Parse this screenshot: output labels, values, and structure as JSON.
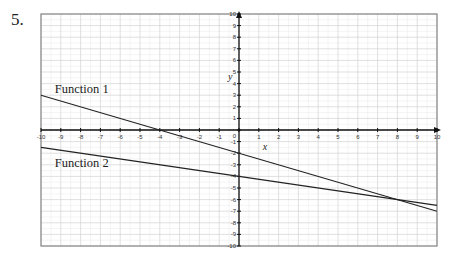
{
  "problem": {
    "number": "5.",
    "cut_text": "...ly ...p ... ...g... ... ...y..."
  },
  "chart_data": {
    "type": "line",
    "title": "",
    "xlabel": "x",
    "ylabel": "y",
    "xlim": [
      -10,
      10
    ],
    "ylim": [
      -10,
      10
    ],
    "grid": true,
    "minor_grid": true,
    "x_ticks": [
      -10,
      -9,
      -8,
      -7,
      -6,
      -5,
      -4,
      -3,
      -2,
      -1,
      0,
      1,
      2,
      3,
      4,
      5,
      6,
      7,
      8,
      9,
      10
    ],
    "y_ticks": [
      -10,
      -9,
      -8,
      -7,
      -6,
      -5,
      -4,
      -3,
      -2,
      -1,
      0,
      1,
      2,
      3,
      4,
      5,
      6,
      7,
      8,
      9,
      10
    ],
    "series": [
      {
        "name": "Function 1",
        "x": [
          -10,
          10
        ],
        "y": [
          3,
          -7
        ],
        "slope": -0.5,
        "intercept": -2,
        "color": "#222222"
      },
      {
        "name": "Function 2",
        "x": [
          -10,
          10
        ],
        "y": [
          -1.5,
          -6.5
        ],
        "slope": -0.25,
        "intercept": -4,
        "color": "#222222"
      }
    ],
    "annotations": [
      {
        "text": "Function 1",
        "x": -9.3,
        "y": 3.2
      },
      {
        "text": "Function 2",
        "x": -9.3,
        "y": -3.2
      }
    ],
    "intersection": {
      "x": 8,
      "y": -6
    }
  }
}
